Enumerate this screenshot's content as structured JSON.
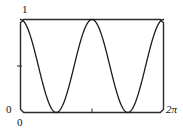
{
  "figure": {
    "name": "cosine-squared-plot",
    "background_color": "#ffffff",
    "curve_color": "#1a1a1a",
    "frame_color": "#2b2b2b"
  },
  "labels": {
    "y_max": "1",
    "y_min": "0",
    "x_min": "0",
    "x_max": "2π"
  },
  "chart_data": {
    "type": "line",
    "title": "",
    "xlabel": "",
    "ylabel": "",
    "xlim": [
      0,
      6.283185307179586
    ],
    "ylim": [
      0,
      1
    ],
    "grid": false,
    "legend": null,
    "xtick_labels": [
      "0",
      "2π"
    ],
    "xtick_values": [
      0,
      6.283185307179586
    ],
    "ytick_labels": [
      "0",
      "1"
    ],
    "ytick_values": [
      0,
      1
    ],
    "minor_ticks": {
      "x": [
        3.141592653589793
      ],
      "y": [
        0.5
      ]
    },
    "series": [
      {
        "name": "cos^2(x)",
        "expression": "cos(x)^2",
        "color": "#1a1a1a",
        "line_width": 1.3,
        "x": [
          0.0,
          0.1309,
          0.2618,
          0.3927,
          0.5236,
          0.6545,
          0.7854,
          0.9163,
          1.0472,
          1.1781,
          1.309,
          1.4399,
          1.5708,
          1.7017,
          1.8326,
          1.9635,
          2.0944,
          2.2253,
          2.3562,
          2.4871,
          2.618,
          2.7489,
          2.8798,
          3.0107,
          3.1416,
          3.2725,
          3.4034,
          3.5343,
          3.6652,
          3.7961,
          3.927,
          4.0579,
          4.1888,
          4.3197,
          4.4506,
          4.5815,
          4.7124,
          4.8433,
          4.9742,
          5.1051,
          5.236,
          5.3669,
          5.4978,
          5.6287,
          5.7596,
          5.8905,
          6.0214,
          6.1523,
          6.2832
        ],
        "y": [
          1.0,
          0.983,
          0.933,
          0.8536,
          0.75,
          0.6294,
          0.5,
          0.3706,
          0.25,
          0.1464,
          0.067,
          0.017,
          0.0,
          0.017,
          0.067,
          0.1464,
          0.25,
          0.3706,
          0.5,
          0.6294,
          0.75,
          0.8536,
          0.933,
          0.983,
          1.0,
          0.983,
          0.933,
          0.8536,
          0.75,
          0.6294,
          0.5,
          0.3706,
          0.25,
          0.1464,
          0.067,
          0.017,
          0.0,
          0.017,
          0.067,
          0.1464,
          0.25,
          0.3706,
          0.5,
          0.6294,
          0.75,
          0.8536,
          0.933,
          0.983,
          1.0
        ]
      }
    ]
  }
}
